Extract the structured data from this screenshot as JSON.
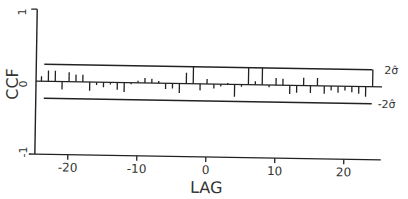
{
  "chart_data": {
    "type": "bar",
    "title": "",
    "xlabel": "LAG",
    "ylabel": "CCF",
    "xlim": [
      -25,
      25
    ],
    "ylim": [
      -1,
      1
    ],
    "x_ticks": [
      -20,
      -10,
      0,
      10,
      20
    ],
    "x_tick_labels": [
      "-20",
      "-10",
      "0",
      "10",
      "20"
    ],
    "y_ticks": [
      -1,
      0,
      1
    ],
    "y_tick_labels": [
      "-1",
      "0",
      "1"
    ],
    "x": [
      -24,
      -23,
      -22,
      -21,
      -20,
      -19,
      -18,
      -17,
      -16,
      -15,
      -14,
      -13,
      -12,
      -11,
      -10,
      -9,
      -8,
      -7,
      -6,
      -5,
      -4,
      -3,
      -2,
      -1,
      0,
      1,
      2,
      3,
      4,
      5,
      6,
      7,
      8,
      9,
      10,
      11,
      12,
      13,
      14,
      15,
      16,
      17,
      18,
      19,
      20,
      21,
      22,
      23,
      24
    ],
    "values": [
      0.07,
      0.15,
      0.15,
      -0.11,
      0.13,
      0.1,
      0.1,
      -0.12,
      -0.04,
      -0.07,
      -0.03,
      -0.1,
      -0.13,
      -0.02,
      0.03,
      0.07,
      0.06,
      0.03,
      -0.08,
      -0.07,
      -0.13,
      0.15,
      0.24,
      -0.09,
      0.07,
      -0.06,
      -0.03,
      0.02,
      -0.17,
      -0.03,
      0.24,
      0.05,
      0.24,
      -0.03,
      0.1,
      0.09,
      -0.12,
      -0.1,
      0.11,
      -0.1,
      0.11,
      -0.11,
      -0.06,
      -0.09,
      -0.06,
      -0.08,
      -0.1,
      -0.14,
      0.24
    ],
    "bounds": {
      "upper": 0.24,
      "lower": -0.24,
      "upper_label": "2σ̂",
      "lower_label": "-2σ̂"
    },
    "grid": false,
    "legend": "none"
  }
}
